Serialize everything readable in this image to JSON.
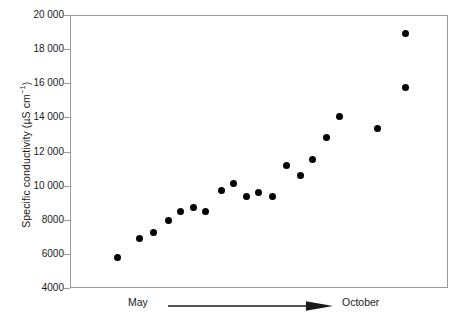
{
  "chart_data": {
    "type": "scatter",
    "title": "",
    "xlabel": "",
    "ylabel": "Specific conductivity (µS cm⁻¹)",
    "ylabel_parts": {
      "text": "Specific conductivity (µS cm",
      "superscript": "−1",
      "closing": ")"
    },
    "ylim": [
      4000,
      20000
    ],
    "ytick_values": [
      4000,
      6000,
      8000,
      10000,
      12000,
      14000,
      16000,
      18000,
      20000
    ],
    "ytick_labels": [
      "4000",
      "6000",
      "8000",
      "10 000",
      "12 000",
      "14 000",
      "16 000",
      "18 000",
      "20 000"
    ],
    "x_axis_annotation": {
      "start_label": "May",
      "end_label": "October",
      "arrow": "rightwards-arrow"
    },
    "grid": false,
    "legend": false,
    "marker": "filled-circle",
    "marker_color": "#000000",
    "axis_color": "#9a9a9a",
    "series": [
      {
        "name": "Specific conductivity",
        "x_index": [
          1,
          2,
          3,
          4,
          5,
          6,
          7,
          8,
          9,
          10,
          11,
          12,
          13,
          14,
          15,
          16,
          17,
          18,
          19
        ],
        "x_fraction": [
          0.124,
          0.182,
          0.217,
          0.259,
          0.291,
          0.323,
          0.357,
          0.399,
          0.429,
          0.463,
          0.497,
          0.534,
          0.571,
          0.608,
          0.64,
          0.677,
          0.709,
          0.812,
          0.884
        ],
        "values": [
          5850,
          6950,
          7300,
          8000,
          8550,
          8800,
          8550,
          9750,
          10200,
          9450,
          9650,
          9400,
          11250,
          10650,
          11600,
          12900,
          14100,
          13400,
          15800
        ]
      }
    ],
    "extra_points": [
      {
        "x_fraction": 0.884,
        "value": 19000
      }
    ],
    "all_values": [
      5850,
      6950,
      7300,
      8000,
      8550,
      8800,
      8550,
      9750,
      10200,
      9450,
      9650,
      9400,
      11250,
      10650,
      11600,
      12900,
      14100,
      13400,
      15800,
      19000
    ],
    "n_points": 20
  }
}
